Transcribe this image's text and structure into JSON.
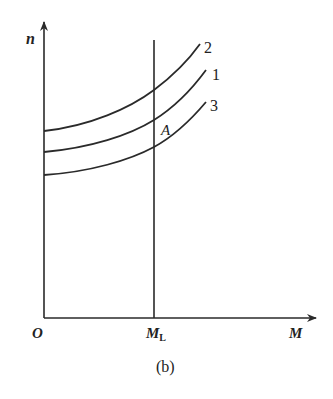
{
  "figure": {
    "caption": "(b)",
    "axes": {
      "y_label": "n",
      "x_label": "M",
      "origin_label": "O",
      "vline_label_main": "M",
      "vline_label_sub": "L"
    },
    "curves": [
      {
        "id": "2",
        "label": "2"
      },
      {
        "id": "1",
        "label": "1"
      },
      {
        "id": "3",
        "label": "3"
      }
    ],
    "point_label": "A",
    "colors": {
      "ink": "#2a2a2a",
      "background": "#ffffff"
    }
  }
}
